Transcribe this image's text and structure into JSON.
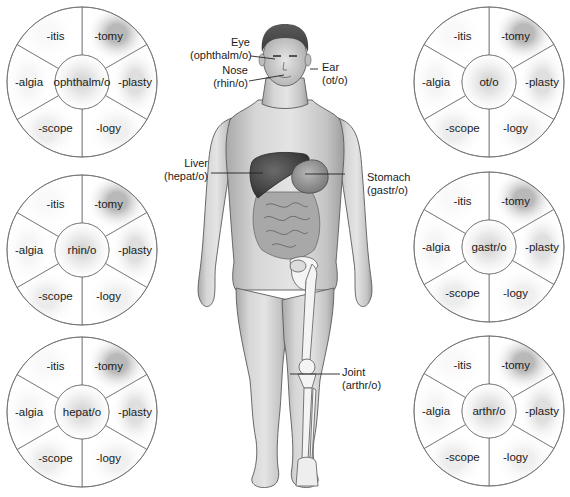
{
  "diagram": {
    "type": "anatomy-word-root-wheels",
    "suffixes": [
      "-itis",
      "-tomy",
      "-plasty",
      "-logy",
      "-scope",
      "-algia"
    ],
    "wheels": [
      {
        "id": "ophthalm",
        "root": "ophthalm/o",
        "cx": 82,
        "cy": 82,
        "suffix_labels": {
          "itis": "-itis",
          "tomy": "-tomy",
          "plasty": "-plasty",
          "logy": "-logy",
          "scope": "-scope",
          "algia": "-algia"
        }
      },
      {
        "id": "rhin",
        "root": "rhin/o",
        "cx": 82,
        "cy": 250,
        "suffix_labels": {
          "itis": "-itis",
          "tomy": "-tomy",
          "plasty": "-plasty",
          "logy": "-logy",
          "scope": "-scope",
          "algia": "-algia"
        }
      },
      {
        "id": "hepat",
        "root": "hepat/o",
        "cx": 82,
        "cy": 412,
        "suffix_labels": {
          "itis": "-itis",
          "tomy": "-tomy",
          "plasty": "-plasty",
          "logy": "-logy",
          "scope": "-scope",
          "algia": "-algia"
        }
      },
      {
        "id": "ot",
        "root": "ot/o",
        "cx": 489,
        "cy": 82,
        "suffix_labels": {
          "itis": "-itis",
          "tomy": "-tomy",
          "plasty": "-plasty",
          "logy": "-logy",
          "scope": "-scope",
          "algia": "-algia"
        }
      },
      {
        "id": "gastr",
        "root": "gastr/o",
        "cx": 489,
        "cy": 247,
        "suffix_labels": {
          "itis": "-itis",
          "tomy": "-tomy",
          "plasty": "-plasty",
          "logy": "-logy",
          "scope": "-scope",
          "algia": "-algia"
        }
      },
      {
        "id": "arthr",
        "root": "arthr/o",
        "cx": 489,
        "cy": 411,
        "suffix_labels": {
          "itis": "-itis",
          "tomy": "-tomy",
          "plasty": "-plasty",
          "logy": "-logy",
          "scope": "-scope",
          "algia": "-algia"
        }
      }
    ],
    "callouts": {
      "eye": {
        "organ": "Eye",
        "root": "(ophthalm/o)"
      },
      "nose": {
        "organ": "Nose",
        "root": "(rhin/o)"
      },
      "ear": {
        "organ": "Ear",
        "root": "(ot/o)"
      },
      "liver": {
        "organ": "Liver",
        "root": "(hepat/o)"
      },
      "stomach": {
        "organ": "Stomach",
        "root": "(gastr/o)"
      },
      "joint": {
        "organ": "Joint",
        "root": "(arthr/o)"
      }
    },
    "colors": {
      "wheel_stroke": "#6e6e6e",
      "wheel_fill": "#ffffff",
      "shade_dark": "#9a9a9a",
      "skin_light": "#e2e2e2",
      "skin_mid": "#bdbdbd",
      "skin_outline": "#555555",
      "organ_dark": "#4a4a4a",
      "bone": "#f4f4f4"
    }
  }
}
